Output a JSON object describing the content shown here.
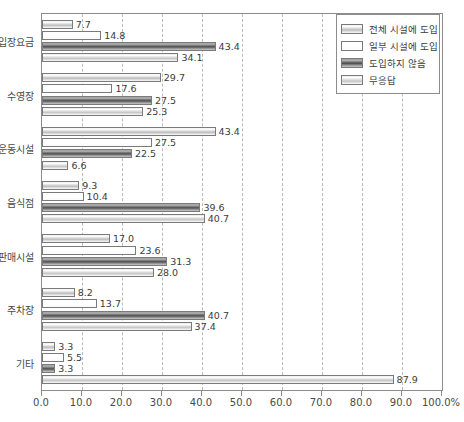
{
  "chart_data": {
    "type": "bar",
    "orientation": "horizontal",
    "title": "",
    "xlabel": "",
    "ylabel": "",
    "xlim": [
      0,
      100
    ],
    "xticks": [
      0,
      10,
      20,
      30,
      40,
      50,
      60,
      70,
      80,
      90,
      100
    ],
    "xtick_labels": [
      "0.0",
      "10.0",
      "20.0",
      "30.0",
      "40.0",
      "50.0",
      "60.0",
      "70.0",
      "80.0",
      "90.0",
      "100.0%"
    ],
    "grid": true,
    "grid_style": "dashed-vertical",
    "legend_position": "top-right",
    "categories": [
      "입장요금",
      "수영장",
      "운동시설",
      "음식점",
      "판매시설",
      "주차장",
      "기타"
    ],
    "series": [
      {
        "name": "전체 시설에 도입",
        "values": [
          7.7,
          29.7,
          43.4,
          9.3,
          17.0,
          8.2,
          3.3
        ],
        "labels": [
          "7.7",
          "29.7",
          "43.4",
          "9.3",
          "17.0",
          "8.2",
          "3.3"
        ]
      },
      {
        "name": "일부 시설에 도입",
        "values": [
          14.8,
          17.6,
          27.5,
          10.4,
          23.6,
          13.7,
          5.5
        ],
        "labels": [
          "14.8",
          "17.6",
          "27.5",
          "10.4",
          "23.6",
          "13.7",
          "5.5"
        ]
      },
      {
        "name": "도입하지 않음",
        "values": [
          43.4,
          27.5,
          22.5,
          39.6,
          31.3,
          40.7,
          3.3
        ],
        "labels": [
          "43.4",
          "27.5",
          "22.5",
          "39.6",
          "31.3",
          "40.7",
          "3.3"
        ]
      },
      {
        "name": "무응답",
        "values": [
          34.1,
          25.3,
          6.6,
          40.7,
          28.0,
          37.4,
          87.9
        ],
        "labels": [
          "34.1",
          "25.3",
          "6.6",
          "40.7",
          "28.0",
          "37.4",
          "87.9"
        ]
      }
    ]
  },
  "colors": {
    "axis": "#8c8c8c",
    "grid": "#b9b9b9",
    "text": "#3b3b3b",
    "background": "#ffffff"
  }
}
